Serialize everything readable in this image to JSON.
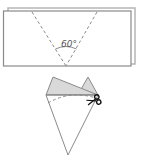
{
  "diagram": {
    "top_figure": {
      "description": "folded rectangular paper with two dashed fold lines meeting at bottom center",
      "angle_label": "60°",
      "colors": {
        "stroke": "#8a8a8a",
        "back_sheet": "#b5b5b5",
        "fill": "#ffffff"
      }
    },
    "bottom_figure": {
      "description": "paper folded into cone with top flaps, dashed cut line and scissors",
      "colors": {
        "stroke": "#8a8a8a",
        "flap_fill": "#d9d9d9",
        "scissors": "#111111"
      },
      "scissors_icon": "scissors-icon"
    }
  }
}
